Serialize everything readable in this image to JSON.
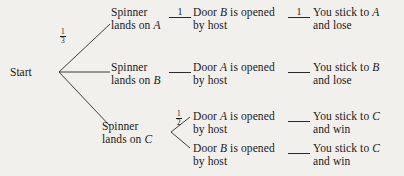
{
  "diagram": {
    "type": "probability-tree",
    "background_color": "#f2f0ec",
    "ink_color": "#1a1a1a",
    "root": {
      "label": "Start"
    },
    "stage1": {
      "branches": [
        {
          "id": "A",
          "line1": "Spinner",
          "line2_prefix": "lands on ",
          "line2_var": "A",
          "probability": {
            "numerator": "1",
            "denominator": "3",
            "shown": true
          }
        },
        {
          "id": "B",
          "line1": "Spinner",
          "line2_prefix": "lands on ",
          "line2_var": "B",
          "probability": {
            "numerator": "",
            "denominator": "",
            "shown": false
          }
        },
        {
          "id": "C",
          "line1": "Spinner",
          "line2_prefix": "lands on ",
          "line2_var": "C",
          "probability": {
            "numerator": "",
            "denominator": "",
            "shown": false
          }
        }
      ]
    },
    "stage2": {
      "rows": [
        {
          "id": "A-doorB",
          "connector_label": "1",
          "line1_prefix": "Door ",
          "line1_var": "B",
          "line1_suffix": " is opened",
          "line2": "by host"
        },
        {
          "id": "B-doorA",
          "connector_label": "",
          "line1_prefix": "Door ",
          "line1_var": "A",
          "line1_suffix": " is opened",
          "line2": "by host"
        },
        {
          "id": "C-doorA",
          "connector_label": "",
          "line1_prefix": "Door ",
          "line1_var": "A",
          "line1_suffix": " is opened",
          "line2": "by host",
          "branch_probability": {
            "numerator": "1",
            "denominator": "2",
            "shown": true
          }
        },
        {
          "id": "C-doorB",
          "connector_label": "",
          "line1_prefix": "Door ",
          "line1_var": "B",
          "line1_suffix": " is opened",
          "line2": "by host",
          "branch_probability": {
            "numerator": "",
            "denominator": "",
            "shown": false
          }
        }
      ]
    },
    "stage3": {
      "outcomes": [
        {
          "id": "stick-A-lose",
          "connector_label": "1",
          "line1_prefix": "You stick to ",
          "line1_var": "A",
          "line2": "and lose"
        },
        {
          "id": "stick-B-lose",
          "connector_label": "",
          "line1_prefix": "You stick to ",
          "line1_var": "B",
          "line2": "and lose"
        },
        {
          "id": "stick-C-win-1",
          "connector_label": "",
          "line1_prefix": "You stick to ",
          "line1_var": "C",
          "line2": "and win"
        },
        {
          "id": "stick-C-win-2",
          "connector_label": "",
          "line1_prefix": "You stick to ",
          "line1_var": "C",
          "line2": "and win"
        }
      ]
    }
  }
}
